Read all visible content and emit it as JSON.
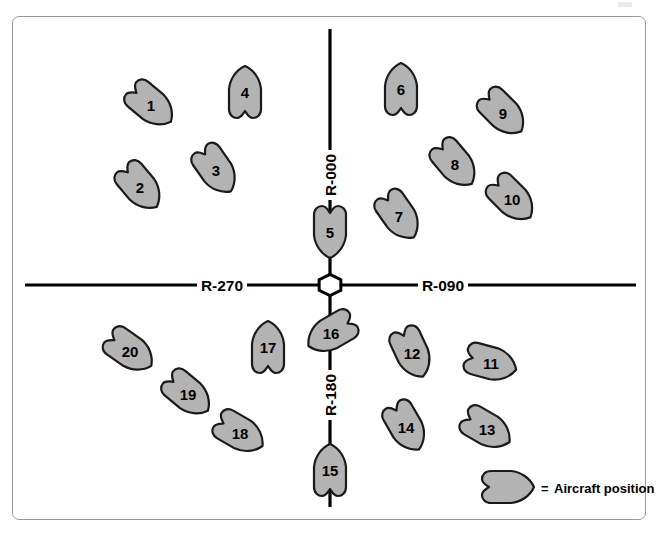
{
  "diagram": {
    "legend": {
      "symbol_name": "aircraft-symbol",
      "equals": "=",
      "label": "Aircraft position"
    },
    "station": {
      "name": "vor-station",
      "shape": "hexagon",
      "x": 330,
      "y": 285
    },
    "colors": {
      "aircraft_fill": "#b3b3b3",
      "aircraft_stroke": "#1a1a1a",
      "radial_line": "#000000",
      "panel_border": "#9a9a9a",
      "background": "#ffffff",
      "text": "#000000"
    },
    "radials": [
      {
        "name": "radial-000",
        "label": "R-000",
        "bearing": 0,
        "label_x": 330,
        "label_y": 175,
        "rotated": true
      },
      {
        "name": "radial-090",
        "label": "R-090",
        "bearing": 90,
        "label_x": 443,
        "label_y": 285,
        "rotated": false
      },
      {
        "name": "radial-180",
        "label": "R-180",
        "bearing": 180,
        "label_x": 330,
        "label_y": 395,
        "rotated": true
      },
      {
        "name": "radial-270",
        "label": "R-270",
        "bearing": 270,
        "label_x": 222,
        "label_y": 285,
        "rotated": false
      }
    ],
    "aircraft": [
      {
        "id": "1",
        "label": "1",
        "x": 151,
        "y": 105,
        "heading": 130
      },
      {
        "id": "2",
        "label": "2",
        "x": 140,
        "y": 187,
        "heading": 140
      },
      {
        "id": "3",
        "label": "3",
        "x": 216,
        "y": 170,
        "heading": 145
      },
      {
        "id": "4",
        "label": "4",
        "x": 245,
        "y": 92,
        "heading": 0
      },
      {
        "id": "5",
        "label": "5",
        "x": 330,
        "y": 232,
        "heading": 180
      },
      {
        "id": "6",
        "label": "6",
        "x": 401,
        "y": 89,
        "heading": 0
      },
      {
        "id": "7",
        "label": "7",
        "x": 399,
        "y": 216,
        "heading": 145
      },
      {
        "id": "8",
        "label": "8",
        "x": 455,
        "y": 164,
        "heading": 140
      },
      {
        "id": "9",
        "label": "9",
        "x": 503,
        "y": 113,
        "heading": 135
      },
      {
        "id": "10",
        "label": "10",
        "x": 512,
        "y": 199,
        "heading": 135
      },
      {
        "id": "11",
        "label": "11",
        "x": 491,
        "y": 363,
        "heading": 105
      },
      {
        "id": "12",
        "label": "12",
        "x": 412,
        "y": 353,
        "heading": 155
      },
      {
        "id": "13",
        "label": "13",
        "x": 487,
        "y": 429,
        "heading": 120
      },
      {
        "id": "14",
        "label": "14",
        "x": 406,
        "y": 427,
        "heading": 150
      },
      {
        "id": "15",
        "label": "15",
        "x": 330,
        "y": 470,
        "heading": 0
      },
      {
        "id": "16",
        "label": "16",
        "x": 331,
        "y": 333,
        "heading": 240
      },
      {
        "id": "17",
        "label": "17",
        "x": 268,
        "y": 347,
        "heading": 0
      },
      {
        "id": "18",
        "label": "18",
        "x": 240,
        "y": 433,
        "heading": 120
      },
      {
        "id": "19",
        "label": "19",
        "x": 188,
        "y": 394,
        "heading": 130
      },
      {
        "id": "20",
        "label": "20",
        "x": 130,
        "y": 351,
        "heading": 125
      }
    ]
  }
}
